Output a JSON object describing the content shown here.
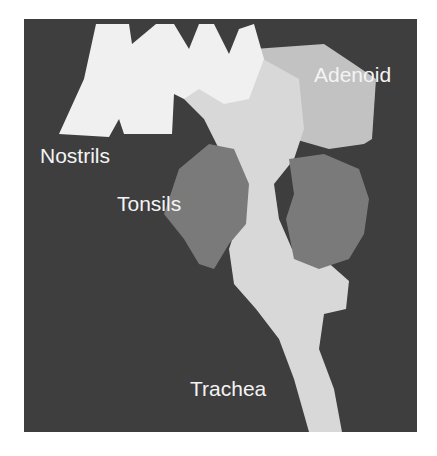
{
  "figure": {
    "type": "3D airway reconstruction (grayscale)",
    "background_color": "#3e3e3e",
    "colors": {
      "airway": "#d8d8d8",
      "nostrils": "#f0f0f0",
      "adenoid": "#c2c2c2",
      "tonsils": "#7a7a7a",
      "label": "#f4f4f4"
    },
    "labels": {
      "nostrils": "Nostrils",
      "adenoid": "Adenoid",
      "tonsils": "Tonsils",
      "trachea": "Trachea"
    }
  }
}
